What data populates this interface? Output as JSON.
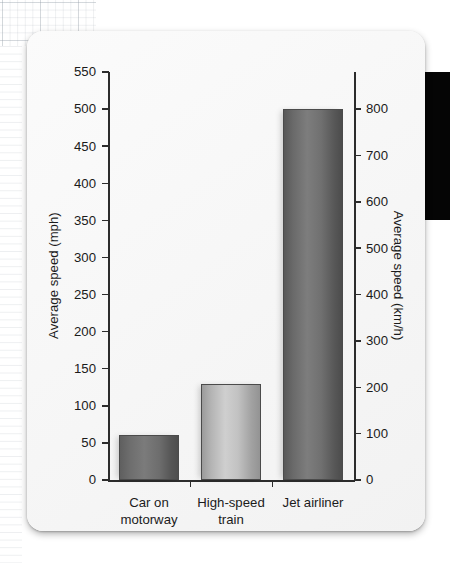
{
  "page": {
    "background": "graph-paper",
    "edge_tab_color": "#050505",
    "card_color": "#f7f7f7"
  },
  "chart_data": {
    "type": "bar",
    "title": "",
    "subtitle": "",
    "categories": [
      "Car on motorway",
      "High-speed train",
      "Jet airliner"
    ],
    "category_lines": [
      [
        "Car on",
        "motorway"
      ],
      [
        "High-speed",
        "train"
      ],
      [
        "Jet airliner"
      ]
    ],
    "values": [
      60,
      130,
      500
    ],
    "values_secondary": [
      97,
      209,
      805
    ],
    "series": [
      {
        "name": "Average speed (mph)",
        "values": [
          60,
          130,
          500
        ]
      }
    ],
    "xlabel": "",
    "ylabel": "Average speed (mph)",
    "ylabel_secondary": "Average speed (km/h)",
    "ylim": [
      0,
      550
    ],
    "ylim_secondary": [
      0,
      880
    ],
    "yticks": [
      0,
      50,
      100,
      150,
      200,
      250,
      300,
      350,
      400,
      450,
      500,
      550
    ],
    "yticks_secondary": [
      0,
      100,
      200,
      300,
      400,
      500,
      600,
      700,
      800
    ],
    "ytick_labels": [
      "0",
      "50",
      "100",
      "150",
      "200",
      "250",
      "300",
      "350",
      "400",
      "450",
      "500",
      "550"
    ],
    "ytick_labels_secondary": [
      "0",
      "100",
      "200",
      "300",
      "400",
      "500",
      "600",
      "700",
      "800"
    ],
    "grid": false,
    "legend": false,
    "legend_position": "none",
    "bar_colors": [
      "#6e6e6e",
      "#c2c2c2",
      "#6a6a6a"
    ],
    "annotations": []
  }
}
